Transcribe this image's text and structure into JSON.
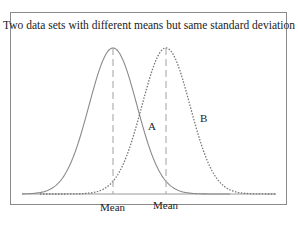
{
  "chart_data": {
    "type": "line",
    "title": "Two data sets with different means but same standard deviation",
    "xlabel": "",
    "ylabel": "",
    "grid": false,
    "legend": "none",
    "series": [
      {
        "name": "A",
        "style": "solid",
        "mean_px": 113,
        "sigma_px": 24
      },
      {
        "name": "B",
        "style": "dotted",
        "mean_px": 166,
        "sigma_px": 24
      }
    ],
    "annotations": [
      {
        "text": "A",
        "x": 152,
        "y": 127
      },
      {
        "text": "B",
        "x": 203,
        "y": 119
      },
      {
        "text": "Mean",
        "x": 113,
        "y": 210
      },
      {
        "text": "Mean",
        "x": 166,
        "y": 210
      }
    ],
    "colors": {
      "curve": "#8a8a8a",
      "mean_line": "#aaaaaa",
      "frame": "#8a8a8a",
      "text": "#222222"
    }
  }
}
